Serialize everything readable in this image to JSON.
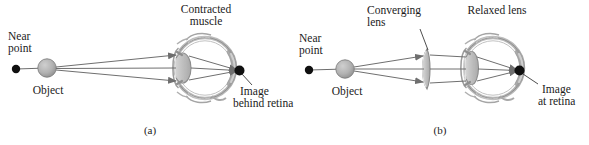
{
  "figure": {
    "background": "#ffffff",
    "ink": "#1b1b1b",
    "ray_color": "#6f6f6f",
    "object_fill": "#b3b3b3",
    "lens_fill": "#c9c9c9",
    "eye_wall": "#8c8c8c"
  },
  "panels": [
    {
      "id": "a",
      "caption": "(a)",
      "labels": {
        "near_point": "Near\npoint",
        "near_point_line1": "Near",
        "near_point_line2": "point",
        "object": "Object",
        "top_label_line1": "Contracted",
        "top_label_line2": "muscle",
        "image_line1": "Image",
        "image_line2": "behind retina"
      }
    },
    {
      "id": "b",
      "caption": "(b)",
      "labels": {
        "near_point_line1": "Near",
        "near_point_line2": "point",
        "object": "Object",
        "lens_label_line1": "Converging",
        "lens_label_line2": "lens",
        "top_label": "Relaxed lens",
        "image_line1": "Image",
        "image_line2": "at retina"
      }
    }
  ]
}
